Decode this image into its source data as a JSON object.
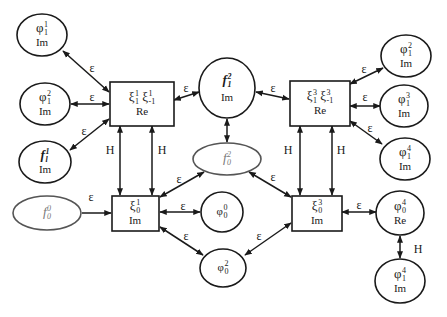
{
  "diagram": {
    "type": "network-of-fields",
    "nodes": {
      "phi1_1_im": {
        "sym": "φ",
        "sup": "1",
        "sub": "1",
        "part": "Im",
        "shape": "ellipse"
      },
      "phi1_2_im_left": {
        "sym": "φ",
        "sup": "2",
        "sub": "1",
        "part": "Im",
        "shape": "ellipse"
      },
      "f1_im": {
        "sym": "f",
        "sup": "1",
        "sub": "l",
        "part": "Im",
        "shape": "ellipse",
        "italic": true
      },
      "f0_0": {
        "sym": "f",
        "sup": "0",
        "sub": "0",
        "part": "",
        "shape": "ellipse",
        "italic": true,
        "gray": true
      },
      "xi1_box_re": {
        "text": "ξ₁¹ ξ₋₁¹",
        "sym1": "ξ",
        "sup1": "1",
        "sub1": "1",
        "sym2": "ξ",
        "sup2": "1",
        "sub2": "-1",
        "part": "Re",
        "shape": "box"
      },
      "xi0_1_box_im": {
        "sym": "ξ",
        "sup": "1",
        "sub": "0",
        "part": "Im",
        "shape": "box"
      },
      "f1_2_im": {
        "sym": "f",
        "sup": "2",
        "sub": "1",
        "part": "Im",
        "shape": "ellipse",
        "italic": true
      },
      "f0_2": {
        "sym": "f",
        "sup": "2",
        "sub": "0",
        "part": "",
        "shape": "ellipse",
        "italic": true,
        "gray": true
      },
      "phi0_0": {
        "sym": "φ",
        "sup": "0",
        "sub": "0",
        "part": "",
        "shape": "ellipse"
      },
      "phi0_2": {
        "sym": "φ",
        "sup": "2",
        "sub": "0",
        "part": "",
        "shape": "ellipse"
      },
      "xi3_box_re": {
        "sym1": "ξ",
        "sup1": "3",
        "sub1": "1",
        "sym2": "ξ",
        "sup2": "3",
        "sub2": "-1",
        "part": "Re",
        "shape": "box"
      },
      "xi0_3_box_im": {
        "sym": "ξ",
        "sup": "3",
        "sub": "0",
        "part": "Im",
        "shape": "box"
      },
      "phi1_2_im_right": {
        "sym": "φ",
        "sup": "2",
        "sub": "1",
        "part": "Im",
        "shape": "ellipse"
      },
      "phi1_3_im": {
        "sym": "φ",
        "sup": "3",
        "sub": "1",
        "part": "Im",
        "shape": "ellipse"
      },
      "phi1_4_im_upper": {
        "sym": "φ",
        "sup": "4",
        "sub": "1",
        "part": "Im",
        "shape": "ellipse"
      },
      "phi0_4_re": {
        "sym": "φ",
        "sup": "4",
        "sub": "0",
        "part": "Re",
        "shape": "ellipse"
      },
      "phi1_4_im_lower": {
        "sym": "φ",
        "sup": "4",
        "sub": "1",
        "part": "Im",
        "shape": "ellipse"
      }
    },
    "edge_labels": {
      "epsilon": "ε",
      "H": "H"
    },
    "edges": [
      {
        "from": "xi1_box_re",
        "to": "phi1_1_im",
        "label": "ε"
      },
      {
        "from": "xi1_box_re",
        "to": "phi1_2_im_left",
        "label": "ε"
      },
      {
        "from": "xi1_box_re",
        "to": "f1_im",
        "label": "ε"
      },
      {
        "from": "xi1_box_re",
        "to": "f1_2_im",
        "label": "ε"
      },
      {
        "from": "xi1_box_re",
        "to": "xi0_1_box_im",
        "label": "H"
      },
      {
        "from": "xi1_box_re",
        "to": "xi0_1_box_im",
        "label": "H"
      },
      {
        "from": "f0_0",
        "to": "xi0_1_box_im",
        "label": "ε"
      },
      {
        "from": "xi0_1_box_im",
        "to": "f0_2",
        "label": "ε"
      },
      {
        "from": "xi0_1_box_im",
        "to": "phi0_0",
        "label": "ε"
      },
      {
        "from": "xi0_1_box_im",
        "to": "phi0_2",
        "label": "ε"
      },
      {
        "from": "f1_2_im",
        "to": "xi3_box_re",
        "label": "ε"
      },
      {
        "from": "f1_2_im",
        "to": "f0_2",
        "label": ""
      },
      {
        "from": "xi3_box_re",
        "to": "phi1_2_im_right",
        "label": "ε"
      },
      {
        "from": "xi3_box_re",
        "to": "phi1_3_im",
        "label": "ε"
      },
      {
        "from": "xi3_box_re",
        "to": "phi1_4_im_upper",
        "label": "ε"
      },
      {
        "from": "xi3_box_re",
        "to": "xi0_3_box_im",
        "label": "H"
      },
      {
        "from": "xi3_box_re",
        "to": "xi0_3_box_im",
        "label": "H"
      },
      {
        "from": "f0_2",
        "to": "xi0_3_box_im",
        "label": "ε"
      },
      {
        "from": "phi0_2",
        "to": "xi0_3_box_im",
        "label": "ε"
      },
      {
        "from": "xi0_3_box_im",
        "to": "phi0_4_re",
        "label": "ε"
      },
      {
        "from": "phi0_4_re",
        "to": "phi1_4_im_lower",
        "label": "H"
      }
    ]
  }
}
